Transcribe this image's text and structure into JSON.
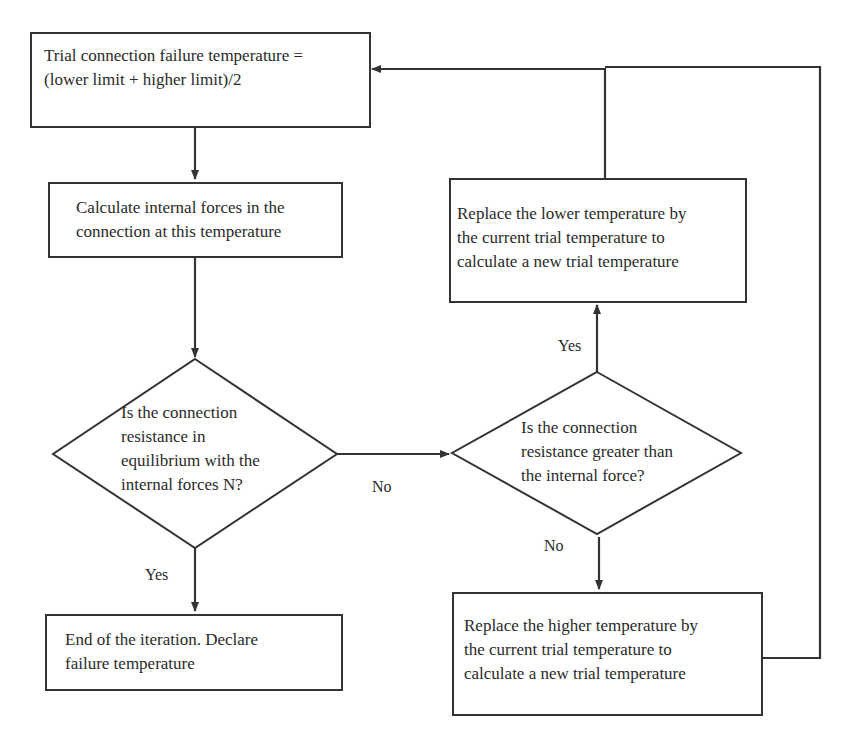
{
  "flowchart": {
    "nodes": {
      "trial_temp": {
        "type": "process",
        "text": "Trial connection failure temperature =\n(lower limit + higher limit)/2"
      },
      "calc_forces": {
        "type": "process",
        "text": "Calculate internal forces in the\nconnection at this temperature"
      },
      "equilibrium_check": {
        "type": "decision",
        "text": "Is the connection\nresistance in\nequilibrium with the\ninternal forces N?"
      },
      "greater_check": {
        "type": "decision",
        "text": "Is the connection\nresistance greater than\nthe internal force?"
      },
      "replace_lower": {
        "type": "process",
        "text": "Replace the lower temperature by\nthe current trial temperature to\ncalculate a new trial temperature"
      },
      "replace_higher": {
        "type": "process",
        "text": "Replace the higher temperature by\nthe current trial temperature to\ncalculate a new trial temperature"
      },
      "end_iteration": {
        "type": "terminal",
        "text": "End of the iteration. Declare\nfailure temperature"
      }
    },
    "edge_labels": {
      "eq_no": "No",
      "eq_yes": "Yes",
      "gt_yes": "Yes",
      "gt_no": "No"
    },
    "edges": [
      {
        "from": "trial_temp",
        "to": "calc_forces"
      },
      {
        "from": "calc_forces",
        "to": "equilibrium_check"
      },
      {
        "from": "equilibrium_check",
        "to": "greater_check",
        "label": "No"
      },
      {
        "from": "equilibrium_check",
        "to": "end_iteration",
        "label": "Yes"
      },
      {
        "from": "greater_check",
        "to": "replace_lower",
        "label": "Yes"
      },
      {
        "from": "greater_check",
        "to": "replace_higher",
        "label": "No"
      },
      {
        "from": "replace_lower",
        "to": "trial_temp"
      },
      {
        "from": "replace_higher",
        "to": "trial_temp"
      }
    ],
    "colors": {
      "stroke": "#333333",
      "text": "#2a2a2a",
      "background": "#ffffff"
    }
  }
}
